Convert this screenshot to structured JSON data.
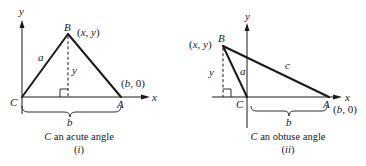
{
  "figure": {
    "colors": {
      "ink": "#1a1a1a",
      "background": "#ffffff"
    },
    "panels": [
      {
        "id": "i",
        "caption_var": "C",
        "caption_rest": " an acute angle",
        "numeral": "(i)",
        "axis_labels": {
          "x": "x",
          "y": "y"
        },
        "vertices": {
          "B": {
            "label": "B",
            "coords": "(x, y)"
          },
          "C": {
            "label": "C"
          },
          "A": {
            "label": "A",
            "coords": "(b, 0)"
          }
        },
        "sides": {
          "a": "a"
        },
        "height_label": "y",
        "base_label": "b"
      },
      {
        "id": "ii",
        "caption_var": "C",
        "caption_rest": " an obtuse angle",
        "numeral": "(ii)",
        "axis_labels": {
          "x": "x",
          "y": "y"
        },
        "vertices": {
          "B": {
            "label": "B",
            "coords": "(x, y)"
          },
          "C": {
            "label": "C"
          },
          "A": {
            "label": "A",
            "coords": "(b, 0)"
          }
        },
        "sides": {
          "a": "a",
          "c": "c"
        },
        "height_label": "y",
        "base_label": "b"
      }
    ]
  }
}
